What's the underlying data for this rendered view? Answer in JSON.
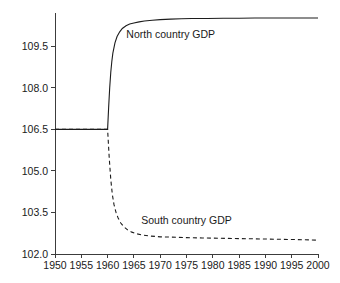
{
  "chart_data": {
    "type": "line",
    "title": "",
    "subtitle": "",
    "xlabel": "",
    "ylabel": "",
    "xlim": [
      1950,
      2000
    ],
    "ylim": [
      102.0,
      110.7
    ],
    "grid": false,
    "legend_position": "inline-annotation",
    "x_ticks": [
      1950,
      1955,
      1960,
      1965,
      1970,
      1975,
      1980,
      1985,
      1990,
      1995,
      2000
    ],
    "x_tick_labels": [
      "1950",
      "1955",
      "1960",
      "1965",
      "1970",
      "1975",
      "1980",
      "1985",
      "1990",
      "1995",
      "2000"
    ],
    "y_ticks": [
      102.0,
      103.5,
      105.0,
      106.5,
      108.0,
      109.5
    ],
    "y_tick_labels": [
      "102.0",
      "103.5",
      "105.0",
      "106.5",
      "108.0",
      "109.5"
    ],
    "annotations": [
      {
        "text": "North country GDP",
        "x": 1972,
        "y": 109.8
      },
      {
        "text": "South country GDP",
        "x": 1975,
        "y": 103.1
      }
    ],
    "series": [
      {
        "name": "North country GDP",
        "label": "North country GDP",
        "style": "solid",
        "color": "#1c1c1c",
        "x": [
          1950,
          1952,
          1954,
          1956,
          1958,
          1959,
          1959.8,
          1960,
          1960.2,
          1960.4,
          1960.6,
          1960.8,
          1961,
          1961.4,
          1961.8,
          1962.3,
          1962.8,
          1963.5,
          1964.2,
          1965,
          1966,
          1967,
          1968.5,
          1970,
          1972,
          1974,
          1976,
          1979,
          1982,
          1985,
          1988,
          1991,
          1994,
          1997,
          2000
        ],
        "values": [
          106.5,
          106.5,
          106.5,
          106.5,
          106.5,
          106.5,
          106.5,
          106.5,
          107.3,
          108.0,
          108.55,
          108.95,
          109.25,
          109.62,
          109.85,
          110.02,
          110.14,
          110.24,
          110.3,
          110.34,
          110.38,
          110.41,
          110.44,
          110.46,
          110.48,
          110.49,
          110.5,
          110.5,
          110.51,
          110.51,
          110.52,
          110.52,
          110.52,
          110.52,
          110.52
        ]
      },
      {
        "name": "South country GDP",
        "label": "South country GDP",
        "style": "dashed",
        "color": "#1c1c1c",
        "x": [
          1950,
          1952,
          1954,
          1956,
          1958,
          1959,
          1959.8,
          1960,
          1960.3,
          1960.6,
          1960.9,
          1961.2,
          1961.6,
          1962,
          1962.5,
          1963,
          1963.8,
          1964.6,
          1965.5,
          1966.5,
          1968,
          1970,
          1972,
          1975,
          1978,
          1981,
          1984,
          1987,
          1990,
          1993,
          1996,
          2000
        ],
        "values": [
          106.5,
          106.5,
          106.5,
          106.5,
          106.5,
          106.5,
          106.5,
          106.5,
          105.5,
          104.7,
          104.15,
          103.8,
          103.5,
          103.3,
          103.12,
          103.0,
          102.87,
          102.79,
          102.73,
          102.69,
          102.65,
          102.62,
          102.61,
          102.59,
          102.58,
          102.57,
          102.56,
          102.55,
          102.54,
          102.53,
          102.52,
          102.5
        ]
      }
    ]
  },
  "layout": {
    "plot_left": 55,
    "plot_right": 318,
    "plot_top": 13,
    "plot_bottom": 254
  }
}
